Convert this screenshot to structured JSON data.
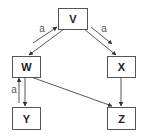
{
  "diagram": {
    "type": "directed-graph",
    "nodes": {
      "v": {
        "label": "V"
      },
      "w": {
        "label": "W"
      },
      "x": {
        "label": "X"
      },
      "y": {
        "label": "Y"
      },
      "z": {
        "label": "Z"
      }
    },
    "edges": [
      {
        "from": "W",
        "to": "V",
        "label": "a"
      },
      {
        "from": "V",
        "to": "W",
        "label": ""
      },
      {
        "from": "V",
        "to": "X",
        "label": "a"
      },
      {
        "from": "V",
        "to": "X",
        "label": ""
      },
      {
        "from": "Y",
        "to": "W",
        "label": "a"
      },
      {
        "from": "W",
        "to": "Y",
        "label": ""
      },
      {
        "from": "W",
        "to": "Z",
        "label": ""
      },
      {
        "from": "X",
        "to": "Z",
        "label": ""
      }
    ],
    "edge_labels": {
      "w_to_v": "a",
      "v_to_x_upper": "a",
      "y_to_w": "a"
    },
    "colors": {
      "background": "#ffffff",
      "node_border": "#555555",
      "edge": "#444444",
      "text": "#222222"
    }
  }
}
